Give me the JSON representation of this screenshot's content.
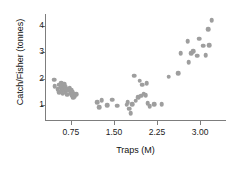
{
  "chart_data": {
    "type": "scatter",
    "title": "",
    "xlabel": "Traps (M)",
    "ylabel": "Catch/Fisher (tonnes)",
    "xlim": [
      0.3,
      3.45
    ],
    "ylim": [
      0.45,
      4.45
    ],
    "xticks": [
      0.75,
      1.5,
      2.25,
      3.0
    ],
    "xticklabels": [
      "0.75",
      "1.50",
      "2.25",
      "3.00"
    ],
    "yticks": [
      1,
      2,
      3,
      4
    ],
    "yticklabels": [
      "1",
      "2",
      "3",
      "4"
    ],
    "grid": false,
    "legend": null,
    "marker": "circle",
    "marker_color": "#9e9e9e",
    "axis_color": "#7d7d7d",
    "points": [
      [
        0.46,
        1.97
      ],
      [
        0.47,
        1.73
      ],
      [
        0.52,
        1.62
      ],
      [
        0.54,
        1.78
      ],
      [
        0.55,
        1.5
      ],
      [
        0.57,
        1.68
      ],
      [
        0.58,
        1.84
      ],
      [
        0.59,
        1.57
      ],
      [
        0.6,
        1.72
      ],
      [
        0.61,
        1.45
      ],
      [
        0.62,
        1.63
      ],
      [
        0.63,
        1.8
      ],
      [
        0.64,
        1.55
      ],
      [
        0.65,
        1.7
      ],
      [
        0.66,
        1.48
      ],
      [
        0.68,
        1.62
      ],
      [
        0.69,
        1.41
      ],
      [
        0.71,
        1.55
      ],
      [
        0.73,
        1.66
      ],
      [
        0.75,
        1.47
      ],
      [
        0.76,
        1.58
      ],
      [
        0.77,
        1.37
      ],
      [
        0.78,
        1.5
      ],
      [
        0.79,
        1.29
      ],
      [
        0.8,
        1.44
      ],
      [
        0.82,
        1.35
      ],
      [
        0.84,
        1.43
      ],
      [
        1.21,
        1.12
      ],
      [
        1.24,
        0.93
      ],
      [
        1.29,
        1.2
      ],
      [
        1.38,
        1.0
      ],
      [
        1.47,
        1.21
      ],
      [
        1.56,
        0.99
      ],
      [
        1.72,
        1.02
      ],
      [
        1.74,
        1.12
      ],
      [
        1.77,
        0.88
      ],
      [
        1.79,
        0.7
      ],
      [
        1.82,
        1.05
      ],
      [
        1.85,
        2.12
      ],
      [
        1.88,
        1.18
      ],
      [
        1.92,
        1.3
      ],
      [
        1.95,
        1.93
      ],
      [
        1.97,
        1.36
      ],
      [
        1.99,
        1.78
      ],
      [
        2.02,
        1.45
      ],
      [
        2.05,
        1.38
      ],
      [
        2.07,
        1.84
      ],
      [
        2.09,
        1.08
      ],
      [
        2.12,
        0.96
      ],
      [
        2.2,
        1.04
      ],
      [
        2.33,
        1.05
      ],
      [
        2.45,
        2.09
      ],
      [
        2.62,
        2.22
      ],
      [
        2.66,
        2.97
      ],
      [
        2.78,
        3.43
      ],
      [
        2.8,
        2.62
      ],
      [
        2.84,
        2.96
      ],
      [
        2.88,
        3.04
      ],
      [
        2.95,
        2.88
      ],
      [
        2.98,
        3.52
      ],
      [
        3.05,
        3.26
      ],
      [
        3.1,
        2.9
      ],
      [
        3.14,
        3.87
      ],
      [
        3.16,
        3.28
      ],
      [
        3.2,
        4.22
      ]
    ]
  }
}
